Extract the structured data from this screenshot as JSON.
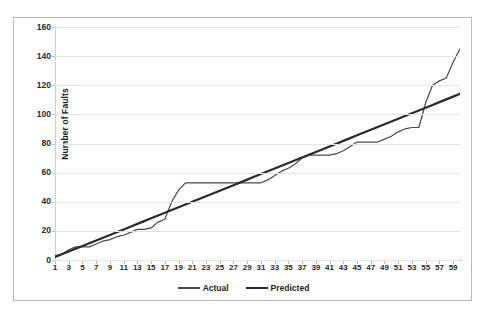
{
  "chart_data": {
    "type": "line",
    "title": "",
    "xlabel": "",
    "ylabel": "Number of Faults",
    "ylim": [
      0,
      160
    ],
    "ytick_step": 20,
    "ytick_labels": [
      "0",
      "20",
      "40",
      "60",
      "80",
      "100",
      "120",
      "140",
      "160"
    ],
    "xlim": [
      1,
      60
    ],
    "xtick_labels": [
      "1",
      "3",
      "5",
      "7",
      "9",
      "11",
      "13",
      "15",
      "17",
      "19",
      "21",
      "23",
      "25",
      "27",
      "29",
      "31",
      "33",
      "35",
      "37",
      "39",
      "41",
      "43",
      "45",
      "47",
      "49",
      "51",
      "53",
      "55",
      "57",
      "59"
    ],
    "grid": true,
    "legend_position": "bottom",
    "x": [
      1,
      2,
      3,
      4,
      5,
      6,
      7,
      8,
      9,
      10,
      11,
      12,
      13,
      14,
      15,
      16,
      17,
      18,
      19,
      20,
      21,
      22,
      23,
      24,
      25,
      26,
      27,
      28,
      29,
      30,
      31,
      32,
      33,
      34,
      35,
      36,
      37,
      38,
      39,
      40,
      41,
      42,
      43,
      44,
      45,
      46,
      47,
      48,
      49,
      50,
      51,
      52,
      53,
      54,
      55,
      56,
      57,
      58,
      59,
      60
    ],
    "series": [
      {
        "name": "Actual",
        "color": "#4a4a4a",
        "width": 1.2,
        "values": [
          3,
          4,
          7,
          9,
          9,
          9,
          11,
          13,
          14,
          16,
          17,
          19,
          21,
          21,
          22,
          26,
          28,
          40,
          48,
          53,
          53,
          53,
          53,
          53,
          53,
          53,
          53,
          53,
          53,
          53,
          53,
          55,
          58,
          61,
          63,
          66,
          70,
          72,
          72,
          72,
          72,
          73,
          75,
          78,
          81,
          81,
          81,
          81,
          83,
          85,
          88,
          90,
          91,
          91,
          108,
          120,
          123,
          125,
          136,
          145
        ]
      },
      {
        "name": "Predicted",
        "color": "#2b2b2b",
        "width": 2.2,
        "values": [
          2,
          3.9,
          5.8,
          7.7,
          9.6,
          11.5,
          13.4,
          15.3,
          17.2,
          19.1,
          21,
          22.9,
          24.8,
          26.7,
          28.6,
          30.5,
          32.4,
          34.3,
          36.2,
          38.1,
          40,
          41.9,
          43.8,
          45.7,
          47.6,
          49.5,
          51.4,
          53.3,
          55.2,
          57.1,
          59,
          60.9,
          62.8,
          64.7,
          66.6,
          68.5,
          70.4,
          72.3,
          74.2,
          76.1,
          78,
          79.9,
          81.8,
          83.7,
          85.6,
          87.5,
          89.4,
          91.3,
          93.2,
          95.1,
          97,
          98.9,
          100.8,
          102.7,
          104.6,
          106.5,
          108.4,
          110.3,
          112.2,
          114.1
        ]
      }
    ]
  },
  "legend": {
    "entries": [
      {
        "label": "Actual"
      },
      {
        "label": "Predicted"
      }
    ]
  }
}
